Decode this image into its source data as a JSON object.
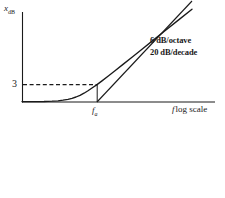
{
  "figure": {
    "background_color": "#ffffff",
    "ink_color": "#1a1a1a"
  },
  "labels": {
    "y_axis_symbol": "x",
    "y_axis_subscript": "dB",
    "y_tick_3": "3",
    "x_axis_symbol": "f",
    "x_axis_text": "log scale",
    "corner_frequency_symbol": "f",
    "corner_frequency_subscript": "a",
    "slope_line_1": "6 dB/octave",
    "slope_line_2": "20 dB/decade"
  },
  "chart_data": {
    "type": "line",
    "title": "",
    "xlabel": "f log scale",
    "ylabel": "x_dB",
    "grid": false,
    "legend": null,
    "axes": {
      "x_origin_px": 22,
      "x_end_px": 215,
      "y_origin_px": 102,
      "y_top_px": 12
    },
    "annotations": [
      {
        "text": "6 dB/octave",
        "x_px": 150,
        "y_px": 36
      },
      {
        "text": "20 dB/decade",
        "x_px": 150,
        "y_px": 48
      }
    ],
    "markers": [
      {
        "name": "corner-frequency",
        "label": "f_a",
        "x_px": 97
      },
      {
        "name": "three-db-level",
        "label": "3",
        "y_px": 85
      }
    ],
    "series": [
      {
        "name": "highpass-response-curve",
        "style": "solid",
        "points_px": [
          [
            22,
            101.6
          ],
          [
            34,
            101.6
          ],
          [
            44,
            101.5
          ],
          [
            52,
            101.2
          ],
          [
            58,
            100.8
          ],
          [
            63,
            100.2
          ],
          [
            68,
            99.3
          ],
          [
            72,
            98.3
          ],
          [
            76,
            97.0
          ],
          [
            80,
            95.3
          ],
          [
            84,
            93.2
          ],
          [
            88,
            90.7
          ],
          [
            92,
            88.0
          ],
          [
            97,
            84.6
          ],
          [
            102,
            80.9
          ],
          [
            108,
            76.3
          ],
          [
            115,
            70.8
          ],
          [
            123,
            64.4
          ],
          [
            132,
            57.2
          ],
          [
            142,
            49.2
          ],
          [
            153,
            40.4
          ],
          [
            165,
            30.8
          ],
          [
            178,
            20.4
          ],
          [
            192,
            9.2
          ]
        ]
      },
      {
        "name": "asymptote-line",
        "style": "solid",
        "points_px": [
          [
            97,
            102
          ],
          [
            192,
            1
          ]
        ]
      },
      {
        "name": "three-db-dashed-guide",
        "style": "dashed",
        "points_px": [
          [
            22,
            84.6
          ],
          [
            97,
            84.6
          ]
        ]
      },
      {
        "name": "corner-frequency-drop-line",
        "style": "solid",
        "points_px": [
          [
            97,
            84.6
          ],
          [
            97,
            102
          ]
        ]
      }
    ]
  }
}
